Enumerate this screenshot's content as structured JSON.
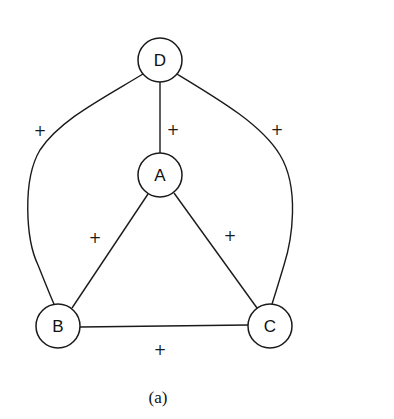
{
  "diagram": {
    "type": "signed-graph",
    "caption": "(a)",
    "nodes": [
      {
        "id": "D",
        "label": "D",
        "x": 160,
        "y": 60
      },
      {
        "id": "A",
        "label": "A",
        "x": 160,
        "y": 175
      },
      {
        "id": "B",
        "label": "B",
        "x": 58,
        "y": 326
      },
      {
        "id": "C",
        "label": "C",
        "x": 270,
        "y": 326
      }
    ],
    "edges": [
      {
        "from": "D",
        "to": "B",
        "sign": "+",
        "label_x": 40,
        "label_y": 131
      },
      {
        "from": "D",
        "to": "A",
        "sign": "+",
        "label_x": 173,
        "label_y": 130
      },
      {
        "from": "D",
        "to": "C",
        "sign": "+",
        "label_x": 277,
        "label_y": 130
      },
      {
        "from": "A",
        "to": "B",
        "sign": "+",
        "label_x": 95,
        "label_y": 238
      },
      {
        "from": "A",
        "to": "C",
        "sign": "+",
        "label_x": 230,
        "label_y": 236
      },
      {
        "from": "B",
        "to": "C",
        "sign": "+",
        "label_x": 160,
        "label_y": 350
      }
    ],
    "colors": {
      "stroke": "#1a1a1a",
      "background": "#ffffff"
    }
  }
}
